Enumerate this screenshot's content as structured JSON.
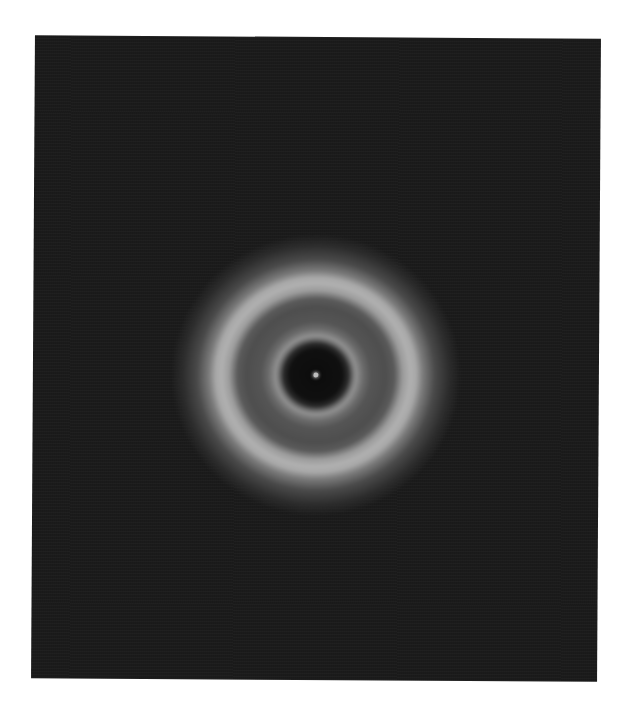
{
  "image": {
    "description": "Grayscale diffraction ring pattern on dark background",
    "subject": "concentric-diffraction-rings",
    "colors": {
      "background_page": "#ffffff",
      "frame_background": "#1b1b1b",
      "dark_core": "#0c0c0c",
      "inner_ring": "#8e8e8e",
      "middle_band": "#4e4e4e",
      "outer_ring": "#b0b0b0",
      "central_spot": "#bdbdbd"
    },
    "rings": [
      {
        "name": "dark-core",
        "radius_px": 28
      },
      {
        "name": "inner-ring",
        "radius_px": 38
      },
      {
        "name": "gray-band",
        "radius_px": 65
      },
      {
        "name": "outer-ring",
        "radius_px": 93
      },
      {
        "name": "outer-glow",
        "radius_px": 135
      }
    ]
  }
}
